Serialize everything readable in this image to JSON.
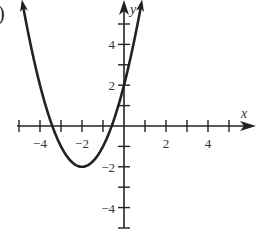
{
  "part_label": ")",
  "chart_data": {
    "type": "line",
    "title": "",
    "function": "y = (x + 2)^2 - 2",
    "xlabel": "x",
    "ylabel": "y",
    "xlim": [
      -5,
      5
    ],
    "ylim": [
      -5,
      5
    ],
    "grid": false,
    "x_tick_labels": [
      {
        "value": -4,
        "label": "−4"
      },
      {
        "value": -2,
        "label": "−2"
      },
      {
        "value": 2,
        "label": "2"
      },
      {
        "value": 4,
        "label": "4"
      }
    ],
    "y_tick_labels": [
      {
        "value": 4,
        "label": "4"
      },
      {
        "value": 2,
        "label": "2"
      },
      {
        "value": -2,
        "label": "−2"
      },
      {
        "value": -4,
        "label": "−4"
      }
    ],
    "series": [
      {
        "name": "parabola",
        "vertex": [
          -2,
          -2
        ],
        "y_intercept": 2,
        "x_intercepts": [
          -3.41,
          -0.59
        ],
        "x": [
          -4.83,
          -4,
          -3.41,
          -3,
          -2,
          -1,
          -0.59,
          0,
          0.83
        ],
        "y": [
          6,
          2,
          0,
          -1,
          -2,
          -1,
          0,
          2,
          6
        ]
      }
    ],
    "color": "#222222"
  }
}
